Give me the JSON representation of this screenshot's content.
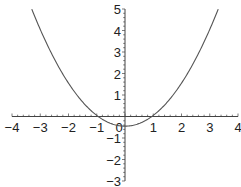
{
  "chart_data": {
    "type": "line",
    "title": "",
    "xlabel": "",
    "ylabel": "",
    "xlim": [
      -4,
      4
    ],
    "ylim": [
      -3,
      5
    ],
    "grid": false,
    "legend": null,
    "x_ticks": [
      -4,
      -3,
      -2,
      -1,
      0,
      1,
      2,
      3,
      4
    ],
    "x_tick_labels": [
      "−4",
      "−3",
      "−2",
      "−1",
      "0",
      "1",
      "2",
      "3",
      "4"
    ],
    "y_ticks": [
      -3,
      -2,
      -1,
      1,
      2,
      3,
      4,
      5
    ],
    "y_tick_labels": [
      "−3",
      "−2",
      "−1",
      "1",
      "2",
      "3",
      "4",
      "5"
    ],
    "series": [
      {
        "name": "parabola",
        "color": "#555555",
        "x": [
          -3.3,
          -3.0,
          -2.5,
          -2.0,
          -1.5,
          -1.0,
          -0.5,
          0.0,
          0.5,
          1.0,
          1.5,
          2.0,
          2.5,
          3.0,
          3.3
        ],
        "y": [
          4.995,
          4.05,
          2.675,
          1.55,
          0.675,
          0.05,
          -0.325,
          -0.45,
          -0.325,
          0.05,
          0.675,
          1.55,
          2.675,
          4.05,
          4.995
        ]
      }
    ]
  },
  "layout": {
    "origin_px": [
      125,
      116.5
    ],
    "x_px_per_unit": 28.25,
    "y_px_per_unit": 21.5,
    "axis_color": "#444444"
  }
}
